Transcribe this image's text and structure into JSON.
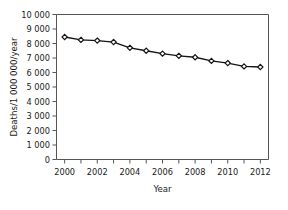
{
  "chart_data": {
    "type": "line",
    "title": "",
    "xlabel": "Year",
    "ylabel": "Deaths/1 000 000/year",
    "x": [
      2000,
      2001,
      2002,
      2003,
      2004,
      2005,
      2006,
      2007,
      2008,
      2009,
      2010,
      2011,
      2012
    ],
    "values": [
      8450,
      8250,
      8200,
      8100,
      7700,
      7500,
      7300,
      7150,
      7050,
      6800,
      6650,
      6420,
      6380
    ],
    "series": [
      {
        "name": "Deaths per million per year",
        "values": [
          8450,
          8250,
          8200,
          8100,
          7700,
          7500,
          7300,
          7150,
          7050,
          6800,
          6650,
          6420,
          6380
        ]
      }
    ],
    "xlim": [
      1999.5,
      2012.5
    ],
    "ylim": [
      0,
      10000
    ],
    "xticks": [
      2000,
      2002,
      2004,
      2006,
      2008,
      2010,
      2012
    ],
    "xtick_labels": [
      "2000",
      "2002",
      "2004",
      "2006",
      "2008",
      "2010",
      "2012"
    ],
    "yticks": [
      0,
      1000,
      2000,
      3000,
      4000,
      5000,
      6000,
      7000,
      8000,
      9000,
      10000
    ],
    "ytick_labels": [
      "0",
      "1 000",
      "2 000",
      "3 000",
      "4 000",
      "5 000",
      "6 000",
      "7 000",
      "8 000",
      "9 000",
      "10 000"
    ],
    "grid": false,
    "legend": false,
    "legend_position": "none",
    "marker_style": "diamond",
    "line_color": "#141414",
    "marker_fill": "#ffffff",
    "marker_edge_color": "#141414",
    "axis_color": "#555555",
    "background_color": "#ffffff"
  }
}
